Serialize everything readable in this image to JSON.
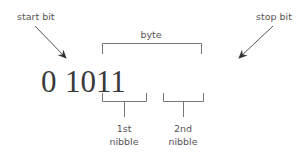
{
  "labels": {
    "start_bit": "start bit",
    "stop_bit": "stop bit",
    "byte": "byte",
    "nibble1_line1": "1st",
    "nibble1_line2": "nibble",
    "nibble2_line1": "2nd",
    "nibble2_line2": "nibble"
  },
  "bits": {
    "start": "0",
    "nibble1": "1011",
    "nibble2": "0110",
    "stop": "1"
  },
  "colors": {
    "text": "#555555",
    "digits": "#3a3a3a",
    "lines": "#777777",
    "arrow": "#444444"
  }
}
